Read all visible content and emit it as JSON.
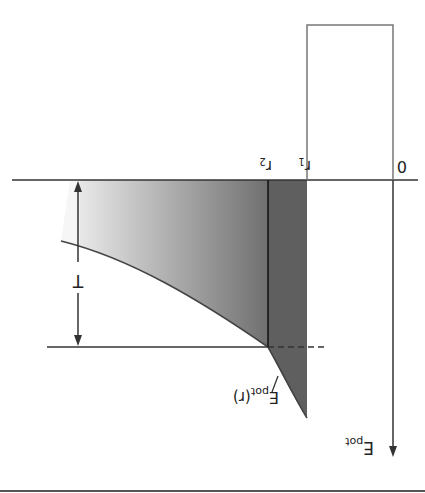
{
  "diagram": {
    "orientation": "rotated 180 degrees",
    "labels": {
      "origin": "0",
      "r1": "r",
      "r1_sub": "1",
      "r2": "r",
      "r2_sub": "2",
      "barrier_height": "T",
      "y_axis": "E",
      "y_axis_sub": "pot",
      "curve": "E",
      "curve_sub": "pot",
      "curve_arg": "(r)"
    },
    "colors": {
      "line": "#333333",
      "box": "#777777",
      "dark_band": "#5a5a5a",
      "gradient_light": "#f2f2f2",
      "gradient_dark": "#6e6e6e",
      "bottom_rule": "#555555"
    }
  }
}
